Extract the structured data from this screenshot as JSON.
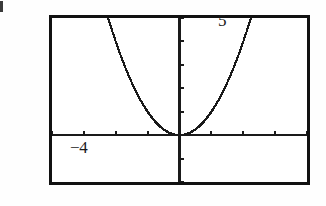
{
  "screen": {
    "kind": "graphing-calculator-viewport",
    "background_color": "#ffffff",
    "frame_color": "#111111",
    "curve_color": "#1a1a1a"
  },
  "labels": {
    "y_max": "5",
    "y_min": "−2",
    "x_min": "−4",
    "x_max": "4"
  },
  "chart_data": {
    "type": "line",
    "title": "",
    "xlabel": "",
    "ylabel": "",
    "xlim": [
      -4,
      4
    ],
    "ylim": [
      -2,
      5
    ],
    "grid": false,
    "legend": null,
    "axes": {
      "x_axis_at_y": 0,
      "y_axis_at_x": 0,
      "x_tick_step": 1,
      "y_tick_step": 1,
      "x_ticks": [
        -4,
        -3,
        -2,
        -1,
        1,
        2,
        3,
        4
      ],
      "y_ticks": [
        -2,
        -1,
        1,
        2,
        3,
        4,
        5
      ],
      "tick_labels_shown": false
    },
    "series": [
      {
        "name": "y = x^2",
        "equation": "y = x^2",
        "style": "dotted",
        "x": [
          -2.24,
          -2.1,
          -2.0,
          -1.9,
          -1.8,
          -1.7,
          -1.6,
          -1.5,
          -1.4,
          -1.3,
          -1.2,
          -1.1,
          -1.0,
          -0.9,
          -0.8,
          -0.7,
          -0.6,
          -0.5,
          -0.4,
          -0.3,
          -0.2,
          -0.1,
          0.0,
          0.1,
          0.2,
          0.3,
          0.4,
          0.5,
          0.6,
          0.7,
          0.8,
          0.9,
          1.0,
          1.1,
          1.2,
          1.3,
          1.4,
          1.5,
          1.6,
          1.7,
          1.8,
          1.9,
          2.0,
          2.1,
          2.24
        ],
        "values": [
          5.0,
          4.41,
          4.0,
          3.61,
          3.24,
          2.89,
          2.56,
          2.25,
          1.96,
          1.69,
          1.44,
          1.21,
          1.0,
          0.81,
          0.64,
          0.49,
          0.36,
          0.25,
          0.16,
          0.09,
          0.04,
          0.01,
          0.0,
          0.01,
          0.04,
          0.09,
          0.16,
          0.25,
          0.36,
          0.49,
          0.64,
          0.81,
          1.0,
          1.21,
          1.44,
          1.69,
          1.96,
          2.25,
          2.56,
          2.89,
          3.24,
          3.61,
          4.0,
          4.41,
          5.0
        ],
        "vertex": [
          0,
          0
        ]
      }
    ]
  }
}
